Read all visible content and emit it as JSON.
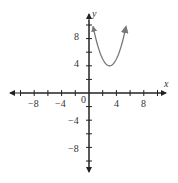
{
  "chart_data": {
    "type": "line",
    "title": "",
    "xlabel": "x",
    "ylabel": "y",
    "xlim": [
      -11,
      11
    ],
    "ylim": [
      -12,
      11
    ],
    "grid": false,
    "origin_label": "0",
    "x_ticks": [
      -10,
      -8,
      -6,
      -4,
      -2,
      2,
      4,
      6,
      8,
      10
    ],
    "x_tick_labels": {
      "-8": "−8",
      "-4": "−4",
      "4": "4",
      "8": "8"
    },
    "y_ticks": [
      -10,
      -8,
      -6,
      -4,
      -2,
      2,
      4,
      6,
      8,
      10
    ],
    "y_tick_labels": {
      "8": "8",
      "4": "4",
      "-4": "−4",
      "-8": "−8"
    },
    "series": [
      {
        "name": "parabola",
        "equation": "y = (x - 3)^2 + 4",
        "vertex": [
          3,
          4
        ],
        "x_range": [
          0.6,
          5.4
        ],
        "arrows_both_ends": true,
        "color": "#777777"
      }
    ]
  },
  "labels": {
    "x_axis": "x",
    "y_axis": "y",
    "origin": "0",
    "xm8": "−8",
    "xm4": "−4",
    "x4": "4",
    "x8": "8",
    "y8": "8",
    "y4": "4",
    "ym4": "−4",
    "ym8": "−8"
  }
}
